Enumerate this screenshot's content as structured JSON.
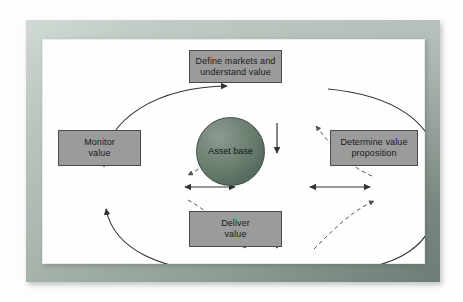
{
  "diagram": {
    "frame": {
      "border_color": "#a3b0a8",
      "panel_color": "#fefefe"
    },
    "colors": {
      "box_fill": "#9b9b9b",
      "box_border": "#4a4a4a",
      "sphere_fill": "#687c6e",
      "arrow_solid": "#333333",
      "arrow_dashed": "#555555"
    },
    "nodes": [
      {
        "id": "define",
        "label": "Define markets and understand value",
        "line1": "Define markets and",
        "line2": "understand value",
        "shape": "rectangle"
      },
      {
        "id": "monitor",
        "label": "Monitor value",
        "line1": "Monitor",
        "line2": "value",
        "shape": "rectangle"
      },
      {
        "id": "determine",
        "label": "Determine value proposition",
        "line1": "Determine value",
        "line2": "proposition",
        "shape": "rectangle"
      },
      {
        "id": "deliver",
        "label": "Deliver value",
        "line1": "Deliver",
        "line2": "value",
        "shape": "rectangle"
      },
      {
        "id": "asset",
        "label": "Asset base",
        "line1": "Asset",
        "line2": "base",
        "shape": "circle"
      }
    ],
    "edges": [
      {
        "from": "monitor",
        "to": "define",
        "style": "solid",
        "shape": "curve",
        "arrow": "single"
      },
      {
        "from": "define",
        "to": "monitor",
        "style": "dashed",
        "shape": "curve",
        "arrow": "single"
      },
      {
        "from": "define",
        "to": "determine",
        "style": "solid",
        "shape": "curve",
        "arrow": "single"
      },
      {
        "from": "determine",
        "to": "define",
        "style": "dashed",
        "shape": "curve",
        "arrow": "single"
      },
      {
        "from": "determine",
        "to": "deliver",
        "style": "solid",
        "shape": "curve",
        "arrow": "single"
      },
      {
        "from": "deliver",
        "to": "determine",
        "style": "dashed",
        "shape": "curve",
        "arrow": "single"
      },
      {
        "from": "deliver",
        "to": "monitor",
        "style": "solid",
        "shape": "curve",
        "arrow": "single"
      },
      {
        "from": "monitor",
        "to": "deliver",
        "style": "dashed",
        "shape": "curve",
        "arrow": "single"
      },
      {
        "from": "define",
        "to": "asset",
        "style": "solid",
        "shape": "straight",
        "arrow": "single"
      },
      {
        "from": "monitor",
        "to": "asset",
        "style": "solid",
        "shape": "straight",
        "arrow": "double"
      },
      {
        "from": "determine",
        "to": "asset",
        "style": "solid",
        "shape": "straight",
        "arrow": "double"
      },
      {
        "from": "deliver",
        "to": "asset",
        "style": "solid",
        "shape": "straight",
        "arrow": "double"
      }
    ]
  }
}
